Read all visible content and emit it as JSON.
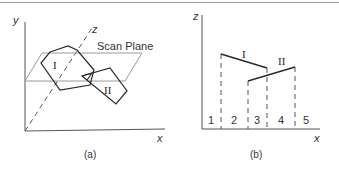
{
  "figure_a": {
    "axis_y_label": "y",
    "axis_z_label": "z",
    "axis_x_label": "x",
    "plane_label": "Scan Plane",
    "polygon_1_label": "I",
    "polygon_2_label": "II",
    "caption": "(a)"
  },
  "figure_b": {
    "axis_z_label": "z",
    "axis_x_label": "x",
    "segment_1_label": "I",
    "segment_2_label": "II",
    "intervals": [
      "1",
      "2",
      "3",
      "4",
      "5"
    ],
    "caption": "(b)"
  },
  "colors": {
    "line": "#2a2a2a",
    "plane": "#9a9a9a",
    "axis": "#555555"
  }
}
